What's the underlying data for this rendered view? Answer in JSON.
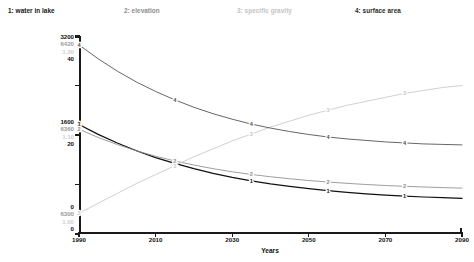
{
  "chart_data": {
    "type": "line",
    "title": "",
    "xlabel": "Years",
    "ylabel": "",
    "grid": false,
    "legend_position": "top",
    "x": [
      1990,
      1995,
      2000,
      2005,
      2010,
      2015,
      2020,
      2025,
      2030,
      2035,
      2040,
      2045,
      2050,
      2055,
      2060,
      2065,
      2070,
      2075,
      2080,
      2085,
      2090
    ],
    "xlim": [
      1990,
      2090
    ],
    "xticks": [
      1990,
      2010,
      2030,
      2050,
      2070,
      2090
    ],
    "xtick_labels": [
      "1990",
      "2010",
      "2030",
      "2050",
      "2070",
      "2090"
    ],
    "axes": [
      {
        "id": 1,
        "name": "water in lake",
        "color": "#111111",
        "ylim": [
          0,
          3200
        ],
        "yticks": [
          0,
          800,
          1600,
          2400,
          3200
        ],
        "tick_labels": [
          "0",
          "",
          "1600",
          "",
          "3200"
        ]
      },
      {
        "id": 2,
        "name": "elevation",
        "color": "#8d8d8d",
        "ylim": [
          6300,
          6420
        ],
        "yticks": [
          6300,
          6330,
          6360,
          6390,
          6420
        ],
        "tick_labels": [
          "6300",
          "",
          "6360",
          "",
          "6420"
        ]
      },
      {
        "id": 3,
        "name": "specific gravity",
        "color": "#c8c8c8",
        "ylim": [
          1.0,
          1.2
        ],
        "yticks": [
          1.0,
          1.05,
          1.1,
          1.15,
          1.2
        ],
        "tick_labels": [
          "1.00",
          "",
          "1.10",
          "",
          "1.20"
        ]
      },
      {
        "id": 4,
        "name": "surface area",
        "color": "#4a4a4a",
        "ylim": [
          0,
          40
        ],
        "yticks": [
          0,
          10,
          20,
          30,
          40
        ],
        "tick_labels": [
          "0",
          "",
          "20",
          "",
          "40"
        ]
      }
    ],
    "series": [
      {
        "id": 1,
        "name": "water in lake",
        "axis": 1,
        "color": "#111111",
        "values": [
          1770,
          1610,
          1470,
          1345,
          1235,
          1140,
          1055,
          980,
          915,
          860,
          810,
          768,
          732,
          700,
          673,
          650,
          630,
          613,
          598,
          586,
          576
        ]
      },
      {
        "id": 2,
        "name": "elevation",
        "axis": 2,
        "color": "#8d8d8d",
        "values": [
          6363.5,
          6358.5,
          6354.2,
          6350.4,
          6347.1,
          6344.3,
          6341.8,
          6339.6,
          6337.7,
          6336.1,
          6334.7,
          6333.5,
          6332.4,
          6331.5,
          6330.7,
          6330.0,
          6329.4,
          6328.9,
          6328.5,
          6328.1,
          6327.8
        ]
      },
      {
        "id": 3,
        "name": "specific gravity",
        "axis": 3,
        "color": "#c8c8c8",
        "values": [
          1.021,
          1.031,
          1.041,
          1.051,
          1.06,
          1.069,
          1.078,
          1.086,
          1.094,
          1.101,
          1.108,
          1.114,
          1.12,
          1.125,
          1.13,
          1.134,
          1.138,
          1.142,
          1.145,
          1.148,
          1.15
        ]
      },
      {
        "id": 4,
        "name": "surface area",
        "axis": 4,
        "color": "#4a4a4a",
        "values": [
          38.2,
          35.4,
          32.9,
          30.7,
          28.8,
          27.1,
          25.6,
          24.3,
          23.2,
          22.2,
          21.4,
          20.7,
          20.1,
          19.6,
          19.2,
          18.9,
          18.6,
          18.4,
          18.2,
          18.1,
          18.0
        ]
      }
    ]
  },
  "legend": {
    "entries": [
      {
        "label": "1: water in lake"
      },
      {
        "label": "2: elevation"
      },
      {
        "label": "3: specific gravity"
      },
      {
        "label": "4: surface area"
      }
    ]
  },
  "y_axis_labels": {
    "top": {
      "s0": "3200",
      "s1": "6420",
      "s2": "1.20",
      "s3": "40"
    },
    "middle": {
      "s0": "1600",
      "s1": "6360",
      "s2": "1.10",
      "s3": "20"
    },
    "bottom": {
      "s0": "0",
      "s1": "6300",
      "s2": "1.00",
      "s3": "0"
    }
  },
  "x_axis": {
    "title": "Years",
    "tick_labels": [
      "1990",
      "2010",
      "2030",
      "2050",
      "2070",
      "2090"
    ]
  }
}
